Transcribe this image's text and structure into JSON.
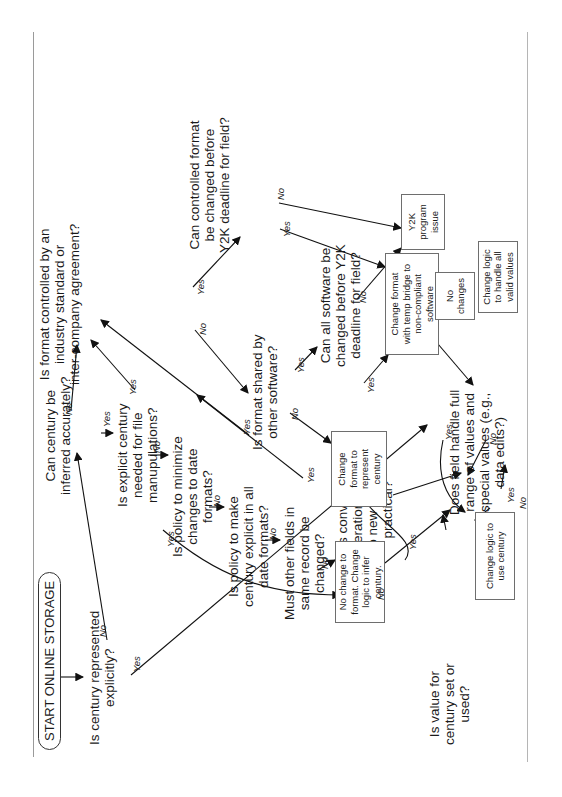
{
  "diagram": {
    "orientation": "rotated -90 degrees (reads bottom to top)",
    "start": "START ONLINE STORAGE",
    "decisions": {
      "represented": [
        "Is century represented",
        "explicitly?"
      ],
      "inferred": [
        "Can century be",
        "inferred accurately?"
      ],
      "explicit_needed": [
        "Is explicit century",
        "needed for file",
        "manupulations?"
      ],
      "minimize": [
        "Is policy to minimize",
        "changes to date",
        "formats?"
      ],
      "make_explicit": [
        "Is policy to make",
        "century explicit in all",
        "date formats?"
      ],
      "other_fields": [
        "Must other fields in",
        "same record be",
        "changed?"
      ],
      "converting": [
        "Is converting",
        "operational data",
        "to new format",
        "practical?"
      ],
      "controlled": [
        "Is format controlled by an",
        "industry standard or",
        "inter-company agreement?"
      ],
      "shared": [
        "Is format shared by",
        "other software?"
      ],
      "all_software": [
        "Can all software be",
        "changed before Y2K",
        "deadline for field?"
      ],
      "controlled_changed": [
        "Can controlled format",
        "be changed before",
        "Y2K deadline for field?"
      ],
      "full_range": [
        "Does field handle full",
        "range of values and",
        "special values (e.g.,",
        "data edits?)"
      ],
      "value_set": [
        "Is value for",
        "century set or",
        "used?"
      ]
    },
    "actions": {
      "no_change_infer": [
        "No change to",
        "format. Change",
        "logic to infer",
        "century."
      ],
      "change_represent": [
        "Change",
        "format to",
        "represent",
        "century"
      ],
      "temp_bridge": [
        "Change format",
        "with temp bridge to",
        "non-compliant",
        "software"
      ],
      "y2k_issue": [
        "Y2K",
        "program",
        "issue"
      ],
      "no_changes": [
        "No",
        "changes"
      ],
      "handle_all": [
        "Change logic",
        "to  handle all",
        "valid values"
      ],
      "use_century": [
        "Change logic to",
        "use century"
      ]
    },
    "edge_labels": {
      "yes": "Yes",
      "no": "No"
    }
  }
}
